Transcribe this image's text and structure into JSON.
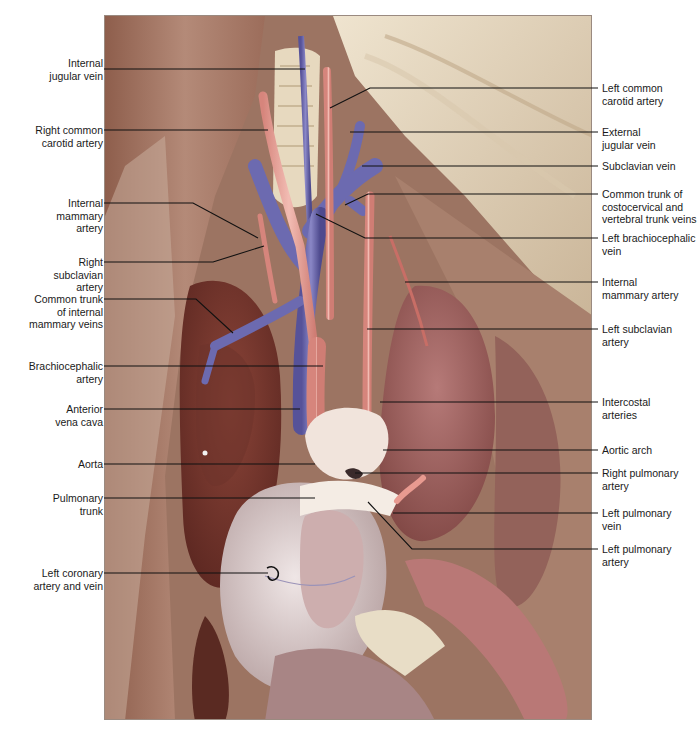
{
  "figure": {
    "colors": {
      "artery": "#e3a39a",
      "vein": "#6c6ab0",
      "heart": "#d9cfcf",
      "lung": "#9b5a55",
      "muscle": "#a8836e",
      "fat": "#e9dcc4",
      "leader": "#111111"
    }
  },
  "labels_left": [
    {
      "id": "internal-jugular-vein",
      "text": "Internal\njugular vein",
      "x": 22,
      "y": 63,
      "lineY": 69,
      "to": [
        305,
        69
      ]
    },
    {
      "id": "right-common-carotid-artery",
      "text": "Right common\ncarotid artery",
      "x": 10,
      "y": 125,
      "lineY": 130,
      "to": [
        268,
        130
      ]
    },
    {
      "id": "internal-mammary-artery-left-label",
      "text": "Internal\nmammary\nartery",
      "x": 40,
      "y": 196,
      "lineY": 203,
      "to": [
        193,
        203
      ],
      "to2": [
        258,
        238
      ]
    },
    {
      "id": "right-subclavian-artery",
      "text": "Right\nsubclavian\nartery",
      "x": 40,
      "y": 256,
      "lineY": 262,
      "to": [
        213,
        262
      ],
      "to2": [
        264,
        246
      ]
    },
    {
      "id": "common-trunk-internal-mammary-veins",
      "text": "Common trunk\nof internal\nmammary veins",
      "x": 8,
      "y": 295,
      "lineY": 299,
      "to": [
        196,
        299
      ],
      "to2": [
        233,
        333
      ]
    },
    {
      "id": "brachiocephalic-artery",
      "text": "Brachiocephalic\nartery",
      "x": 8,
      "y": 360,
      "lineY": 366,
      "to": [
        323,
        366
      ]
    },
    {
      "id": "anterior-vena-cava",
      "text": "Anterior\nvena cava",
      "x": 42,
      "y": 403,
      "lineY": 409,
      "to": [
        300,
        409
      ]
    },
    {
      "id": "aorta",
      "text": "Aorta",
      "x": 59,
      "y": 458,
      "lineY": 464,
      "to": [
        315,
        464
      ]
    },
    {
      "id": "pulmonary-trunk",
      "text": "Pulmonary\ntrunk",
      "x": 37,
      "y": 492,
      "lineY": 498,
      "to": [
        315,
        498
      ]
    },
    {
      "id": "left-coronary-artery-and-vein",
      "text": "Left coronary\nartery and vein",
      "x": 11,
      "y": 567,
      "lineY": 573,
      "to": [
        268,
        573
      ]
    }
  ],
  "labels_right": [
    {
      "id": "left-common-carotid-artery",
      "text": "Left common\ncarotid artery",
      "x": 602,
      "y": 83,
      "lineY": 88,
      "from": [
        370,
        88
      ],
      "via": [
        330,
        108
      ]
    },
    {
      "id": "external-jugular-vein",
      "text": "External\njugular vein",
      "x": 602,
      "y": 127,
      "lineY": 132,
      "from": [
        350,
        132
      ]
    },
    {
      "id": "subclavian-vein",
      "text": "Subclavian vein",
      "x": 602,
      "y": 160,
      "lineY": 166,
      "from": [
        362,
        166
      ]
    },
    {
      "id": "common-trunk-costocervical-vertebral-veins",
      "text": "Common trunk of\ncostocervical and\nvertebral trunk veins",
      "x": 602,
      "y": 188,
      "lineY": 194,
      "from": [
        368,
        194
      ],
      "via": [
        345,
        205
      ]
    },
    {
      "id": "left-brachiocephalic-vein",
      "text": "Left brachiocephalic\nvein",
      "x": 602,
      "y": 232,
      "lineY": 238,
      "from": [
        365,
        238
      ],
      "via": [
        316,
        214
      ]
    },
    {
      "id": "internal-mammary-artery-right-label",
      "text": "Internal\nmammary artery",
      "x": 602,
      "y": 276,
      "lineY": 282,
      "from": [
        405,
        282
      ]
    },
    {
      "id": "left-subclavian-artery",
      "text": "Left subclavian\nartery",
      "x": 602,
      "y": 323,
      "lineY": 329,
      "from": [
        367,
        329
      ]
    },
    {
      "id": "intercostal-arteries",
      "text": "Intercostal\narteries",
      "x": 602,
      "y": 396,
      "lineY": 402,
      "from": [
        380,
        402
      ]
    },
    {
      "id": "aortic-arch",
      "text": "Aortic arch",
      "x": 602,
      "y": 444,
      "lineY": 450,
      "from": [
        383,
        450
      ]
    },
    {
      "id": "right-pulmonary-artery",
      "text": "Right pulmonary\nartery",
      "x": 602,
      "y": 467,
      "lineY": 473,
      "from": [
        355,
        473
      ]
    },
    {
      "id": "left-pulmonary-vein",
      "text": "Left pulmonary\nvein",
      "x": 602,
      "y": 507,
      "lineY": 513,
      "from": [
        393,
        513
      ]
    },
    {
      "id": "left-pulmonary-artery",
      "text": "Left pulmonary\nartery",
      "x": 602,
      "y": 544,
      "lineY": 549,
      "from": [
        412,
        549
      ],
      "via": [
        368,
        502
      ]
    }
  ]
}
